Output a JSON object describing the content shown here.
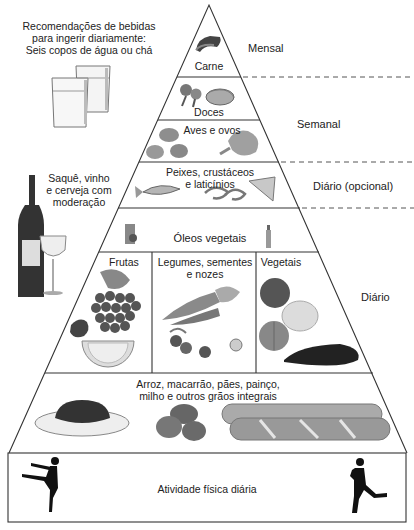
{
  "diagram": {
    "type": "food-pyramid",
    "colors": {
      "line": "#333333",
      "dash": "#555555",
      "background": "#ffffff"
    }
  },
  "beverages_note": {
    "lines": [
      "Recomendações de bebidas",
      "para ingerir diariamente:",
      "Seis copos de água ou chá"
    ],
    "icon": "water-glasses-icon"
  },
  "alcohol_note": {
    "lines": [
      "Saquê, vinho",
      "e cerveja com",
      "moderação"
    ],
    "icon": "wine-bottle-glass-icon"
  },
  "tiers": [
    {
      "id": "carne",
      "label": "Carne",
      "icons": [
        "meat-icon"
      ]
    },
    {
      "id": "doces",
      "label": "Doces",
      "icons": [
        "lollipop-icon",
        "candy-icon"
      ]
    },
    {
      "id": "aves",
      "label": "Aves e ovos",
      "icons": [
        "eggs-icon",
        "chicken-leg-icon"
      ]
    },
    {
      "id": "peixes",
      "lines": [
        "Peixes, crustáceos",
        "e laticínios"
      ],
      "icons": [
        "fish-icon",
        "shrimp-icon",
        "cheese-icon"
      ]
    },
    {
      "id": "oleos",
      "label": "Óleos vegetais",
      "icons": [
        "olive-oil-icon",
        "oil-bottle-icon"
      ]
    },
    {
      "id": "frutas",
      "label": "Frutas",
      "icons": [
        "strawberry-icon",
        "grapes-icon",
        "orange-slice-icon"
      ]
    },
    {
      "id": "legumes",
      "lines": [
        "Legumes, sementes",
        "e nozes"
      ],
      "icons": [
        "carrot-icon",
        "radish-icon",
        "walnut-icon"
      ]
    },
    {
      "id": "vegetais",
      "label": "Vegetais",
      "icons": [
        "tomato-icon",
        "cauliflower-icon",
        "onion-icon",
        "eggplant-icon"
      ]
    },
    {
      "id": "graos",
      "lines": [
        "Arroz, macarrão, pães, painço,",
        "milho e outros grãos integrais"
      ],
      "icons": [
        "rice-plate-icon",
        "potatoes-icon",
        "baguette-icon"
      ]
    },
    {
      "id": "atividade",
      "label": "Atividade física diária",
      "icons": [
        "dancer-icon",
        "runner-icon"
      ]
    }
  ],
  "frequency_labels": {
    "mensal": "Mensal",
    "semanal": "Semanal",
    "diario_opcional": "Diário (opcional)",
    "diario": "Diário"
  }
}
